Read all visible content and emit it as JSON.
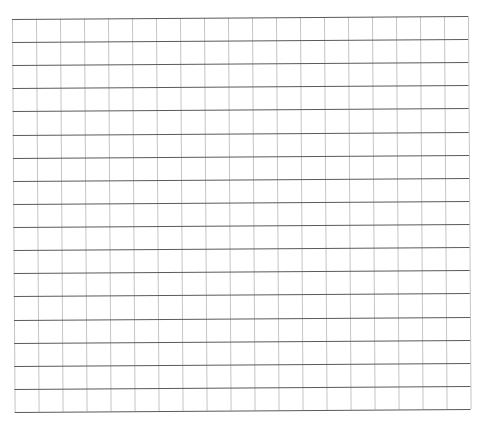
{
  "grid": {
    "columns": 19,
    "rows": 17,
    "horizontal_line_color": "#5a5a5a",
    "vertical_line_color": "#c4c4c4",
    "background": "#ffffff"
  }
}
